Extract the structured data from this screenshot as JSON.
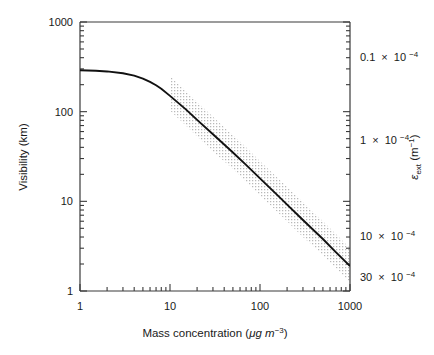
{
  "figure": {
    "background": "#ffffff",
    "line_color": "#111111",
    "band_color": "#c9c9c9",
    "axis_color": "#3a3a3a"
  },
  "axes": {
    "x": {
      "label_main": "Mass concentration (",
      "label_mu": "μg m",
      "label_sup": "−3",
      "label_close": ")",
      "label_full": "Mass concentration (μg m−3)",
      "scale": "log",
      "range": [
        1,
        1000
      ],
      "ticks": [
        1,
        10,
        100,
        1000
      ],
      "tick_labels": [
        "1",
        "10",
        "100",
        "1000"
      ]
    },
    "y_left": {
      "label": "Visibility (km)",
      "scale": "log",
      "range": [
        1,
        1000
      ],
      "ticks": [
        1,
        10,
        100,
        1000
      ],
      "tick_labels": [
        "1",
        "10",
        "100",
        "1000"
      ]
    },
    "y_right": {
      "label_sym": "ε",
      "label_sub": "ext",
      "label_unit": " (m",
      "label_unit_sup": "−1",
      "label_unit_close": ")",
      "label_full": "εext (m−1)",
      "scale": "log",
      "tick_labels": [
        {
          "mantissa": "0.1",
          "times": "×",
          "base": "10",
          "exp": "−4",
          "text": "0.1 × 10−4",
          "y_px": 57
        },
        {
          "mantissa": "1",
          "times": "×",
          "base": "10",
          "exp": "−4",
          "text": "1 × 10−4",
          "y_px": 140
        },
        {
          "mantissa": "10",
          "times": "×",
          "base": "10",
          "exp": "−4",
          "text": "10 × 10−4",
          "y_px": 236
        },
        {
          "mantissa": "30",
          "times": "×",
          "base": "10",
          "exp": "−4",
          "text": "30 × 10−4",
          "y_px": 277
        }
      ]
    }
  },
  "chart_data": {
    "type": "line",
    "title": "",
    "xlabel": "Mass concentration (μg m−3)",
    "ylabel": "Visibility (km)",
    "ylabel_secondary": "εext (m−1)",
    "xscale": "log",
    "yscale": "log",
    "xlim": [
      1,
      1000
    ],
    "ylim": [
      1,
      1000
    ],
    "grid": false,
    "legend": null,
    "series": [
      {
        "name": "Visibility vs mass concentration",
        "style": "solid-line",
        "x": [
          1,
          1.5,
          2,
          3,
          4,
          5,
          6,
          7,
          8,
          10,
          15,
          20,
          30,
          40,
          50,
          70,
          100,
          150,
          200,
          300,
          400,
          500,
          700,
          1000
        ],
        "y": [
          290,
          286,
          281,
          268,
          252,
          234,
          215,
          197,
          180,
          150,
          106,
          81,
          56,
          43,
          35,
          25.5,
          18,
          12.2,
          9.2,
          6.2,
          4.7,
          3.8,
          2.7,
          1.9
        ]
      },
      {
        "name": "Uncertainty band (stippled)",
        "style": "stippled-area",
        "x_start": 10,
        "x_end": 1000,
        "upper_y": [
          250,
          170,
          128,
          88,
          67,
          55,
          40,
          28,
          19,
          14.5,
          9.8,
          7.4,
          6.0,
          4.3,
          3.0
        ],
        "lower_y": [
          103,
          70,
          53,
          36,
          28,
          23,
          16.5,
          11.6,
          7.9,
          6.0,
          4.0,
          3.1,
          2.5,
          1.8,
          1.25
        ],
        "x_nodes": [
          10,
          15,
          20,
          30,
          40,
          50,
          70,
          100,
          150,
          200,
          300,
          400,
          500,
          700,
          1000
        ]
      }
    ],
    "annotations": []
  }
}
